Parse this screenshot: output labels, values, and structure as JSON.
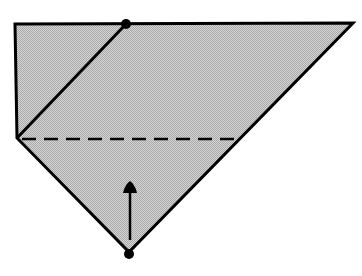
{
  "diagram": {
    "type": "origami-fold-step",
    "colors": {
      "paper_fill": "#c4c4c4",
      "line": "#000000",
      "background": "#ffffff"
    },
    "elements": {
      "paper": "folded-paper-shape",
      "diagonal_crease": "existing-diagonal-fold-edge",
      "fold_line": "valley-fold-dashed-line",
      "arrow": "fold-up-arrow",
      "top_marker": "reference-point-dot",
      "bottom_marker": "reference-point-dot"
    }
  }
}
